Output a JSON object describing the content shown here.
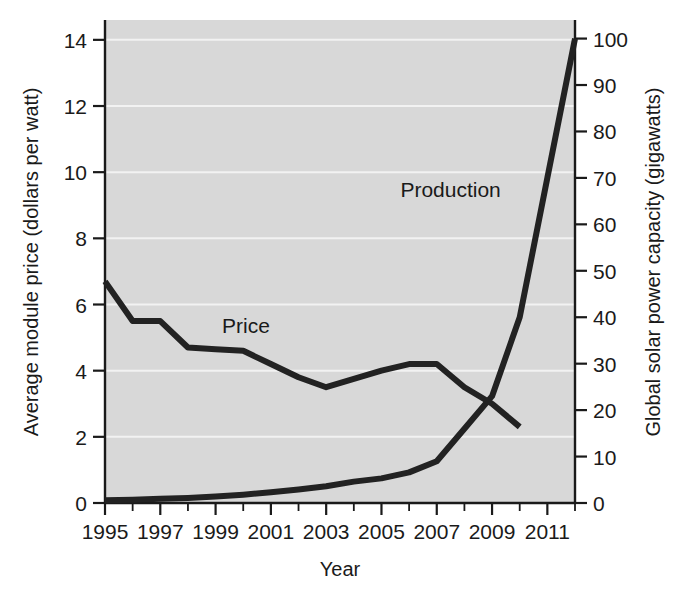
{
  "chart_data": {
    "type": "line",
    "title": "",
    "xlabel": "Year",
    "ylabel": "Average module price (dollars per watt)",
    "y2label": "Global solar power capacity (gigawatts)",
    "grid": true,
    "legend_position": "inline-annotations",
    "xlim": [
      1995,
      2012
    ],
    "ylim": [
      0,
      14.6
    ],
    "y2lim": [
      0,
      104
    ],
    "x_major_ticks": [
      1995,
      1997,
      1999,
      2001,
      2003,
      2005,
      2007,
      2009,
      2011
    ],
    "x_minor_ticks": [
      1996,
      1998,
      2000,
      2002,
      2004,
      2006,
      2008,
      2010,
      2012
    ],
    "y_ticks": [
      0,
      2,
      4,
      6,
      8,
      10,
      12,
      14
    ],
    "y_tick_labels": [
      "0",
      "2",
      "4",
      "6",
      "8",
      "10",
      "12",
      "14"
    ],
    "y2_ticks": [
      0,
      10,
      20,
      30,
      40,
      50,
      60,
      70,
      80,
      90,
      100
    ],
    "y2_tick_labels": [
      "0",
      "10",
      "20",
      "30",
      "40",
      "50",
      "60",
      "70",
      "80",
      "90",
      "100"
    ],
    "x_tick_labels": [
      "1995",
      "1997",
      "1999",
      "2001",
      "2003",
      "2005",
      "2007",
      "2009",
      "2011"
    ],
    "series": [
      {
        "name": "Price",
        "axis": "left",
        "units": "dollars per watt",
        "label_x": 2000.1,
        "label_y": 5.15,
        "x": [
          1995,
          1996,
          1997,
          1998,
          1999,
          2000,
          2001,
          2002,
          2003,
          2004,
          2005,
          2006,
          2007,
          2008,
          2009,
          2010
        ],
        "values": [
          6.7,
          5.5,
          5.5,
          4.7,
          4.65,
          4.6,
          4.2,
          3.8,
          3.5,
          3.75,
          4.0,
          4.2,
          4.2,
          3.5,
          3.0,
          2.3
        ]
      },
      {
        "name": "Production",
        "axis": "right",
        "units": "gigawatts",
        "label_x": 2007.5,
        "label_y": 66,
        "x": [
          1995,
          1996,
          1997,
          1998,
          1999,
          2000,
          2001,
          2002,
          2003,
          2004,
          2005,
          2006,
          2007,
          2008,
          2009,
          2010,
          2011,
          2012
        ],
        "values": [
          0.6,
          0.7,
          0.9,
          1.1,
          1.4,
          1.8,
          2.3,
          2.9,
          3.6,
          4.6,
          5.3,
          6.6,
          9.0,
          16.0,
          23.0,
          40.0,
          70.0,
          100.0
        ]
      }
    ]
  },
  "colors": {
    "plot_background": "#d8d8d8",
    "page_background": "#ffffff",
    "line": "#222222",
    "gridline": "#f2f2f2",
    "axis": "#1a1a1a",
    "text": "#1a1a1a"
  },
  "labels": {
    "y_axis_title": "Average module price (dollars per watt)",
    "y2_axis_title": "Global solar power capacity (gigawatts)",
    "x_axis_title": "Year",
    "price_annotation": "Price",
    "production_annotation": "Production"
  }
}
